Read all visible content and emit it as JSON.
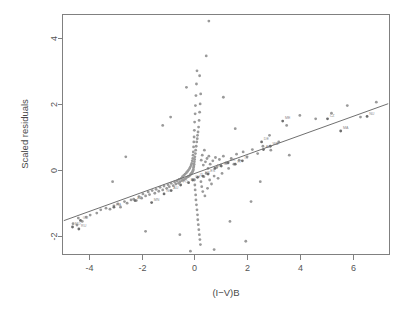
{
  "figure": {
    "title": "",
    "background_color": "#ffffff",
    "width": 411,
    "height": 313
  },
  "axes": {
    "x_title": "(I−V)B",
    "y_title": "Scaled residuals",
    "x_ticks": [
      "-4",
      "-2",
      "0",
      "2",
      "4",
      "6"
    ],
    "y_ticks": [
      "-2",
      "0",
      "2",
      "4"
    ],
    "frame_color": "#808080",
    "tick_color": "#555555"
  },
  "chart_data": {
    "type": "scatter",
    "title": "",
    "xlabel": "(I−V)B",
    "ylabel": "Scaled residuals",
    "xlim": [
      -5.0,
      7.4
    ],
    "ylim": [
      -2.55,
      4.7
    ],
    "xticks": [
      -4,
      -2,
      0,
      2,
      4,
      6
    ],
    "yticks": [
      -2,
      0,
      2,
      4
    ],
    "grid": false,
    "legend": null,
    "point_color": "#9a9a9a",
    "point_size": 1.4,
    "fit_line": {
      "type": "linear",
      "slope": 0.287,
      "intercept": -0.105,
      "x_start": -4.95,
      "y_start": -1.527,
      "x_end": 7.35,
      "y_end": 2.005,
      "color": "#707070"
    },
    "points": [
      [
        -4.6,
        -1.62
      ],
      [
        -4.45,
        -1.66
      ],
      [
        -4.4,
        -1.45
      ],
      [
        -4.25,
        -1.55
      ],
      [
        -4.1,
        -1.42
      ],
      [
        -3.95,
        -1.36
      ],
      [
        -3.7,
        -1.3
      ],
      [
        -3.55,
        -1.2
      ],
      [
        -3.35,
        -1.15
      ],
      [
        -3.2,
        -1.18
      ],
      [
        -3.05,
        -1.08
      ],
      [
        -2.9,
        -1.02
      ],
      [
        -2.8,
        -1.12
      ],
      [
        -2.65,
        -0.95
      ],
      [
        -2.55,
        -1.0
      ],
      [
        -2.4,
        -0.9
      ],
      [
        -2.3,
        -0.88
      ],
      [
        -2.2,
        -0.92
      ],
      [
        -2.1,
        -0.8
      ],
      [
        -2.0,
        -0.85
      ],
      [
        -1.95,
        -0.72
      ],
      [
        -1.85,
        -0.78
      ],
      [
        -1.75,
        -0.66
      ],
      [
        -1.7,
        -0.74
      ],
      [
        -1.6,
        -0.62
      ],
      [
        -1.5,
        -0.7
      ],
      [
        -1.45,
        -0.58
      ],
      [
        -1.35,
        -0.64
      ],
      [
        -1.3,
        -0.52
      ],
      [
        -1.2,
        -0.6
      ],
      [
        -1.15,
        -0.48
      ],
      [
        -1.05,
        -0.55
      ],
      [
        -1.0,
        -0.44
      ],
      [
        -0.95,
        -0.5
      ],
      [
        -0.88,
        -0.4
      ],
      [
        -0.8,
        -0.47
      ],
      [
        -0.75,
        -0.36
      ],
      [
        -0.7,
        -0.42
      ],
      [
        -0.65,
        -0.33
      ],
      [
        -0.6,
        -0.4
      ],
      [
        -0.58,
        -0.28
      ],
      [
        -0.55,
        -0.36
      ],
      [
        -0.5,
        -0.25
      ],
      [
        -0.48,
        -0.32
      ],
      [
        -0.45,
        -0.2
      ],
      [
        -0.42,
        -0.3
      ],
      [
        -0.4,
        -0.16
      ],
      [
        -0.38,
        -0.28
      ],
      [
        -0.35,
        -0.12
      ],
      [
        -0.33,
        -0.26
      ],
      [
        -0.3,
        -0.08
      ],
      [
        -0.28,
        -0.22
      ],
      [
        -0.26,
        -0.04
      ],
      [
        -0.24,
        -0.2
      ],
      [
        -0.22,
        0.0
      ],
      [
        -0.2,
        -0.18
      ],
      [
        -0.18,
        0.05
      ],
      [
        -0.16,
        -0.15
      ],
      [
        -0.15,
        0.1
      ],
      [
        -0.14,
        -0.12
      ],
      [
        -0.12,
        0.15
      ],
      [
        -0.11,
        -0.1
      ],
      [
        -0.1,
        0.2
      ],
      [
        -0.09,
        -0.08
      ],
      [
        -0.08,
        0.28
      ],
      [
        -0.07,
        -0.05
      ],
      [
        -0.06,
        0.35
      ],
      [
        -0.05,
        -0.02
      ],
      [
        -0.05,
        0.45
      ],
      [
        -0.04,
        0.02
      ],
      [
        -0.04,
        0.55
      ],
      [
        -0.03,
        0.08
      ],
      [
        -0.03,
        0.7
      ],
      [
        -0.02,
        0.12
      ],
      [
        -0.02,
        0.85
      ],
      [
        -0.01,
        0.18
      ],
      [
        -0.01,
        1.0
      ],
      [
        0.0,
        0.25
      ],
      [
        0.0,
        1.2
      ],
      [
        0.0,
        -0.3
      ],
      [
        0.01,
        0.32
      ],
      [
        0.01,
        1.45
      ],
      [
        0.02,
        -0.45
      ],
      [
        0.02,
        0.4
      ],
      [
        0.03,
        1.7
      ],
      [
        0.03,
        -0.6
      ],
      [
        0.04,
        0.5
      ],
      [
        0.04,
        1.95
      ],
      [
        0.05,
        -0.75
      ],
      [
        0.05,
        0.6
      ],
      [
        0.06,
        2.25
      ],
      [
        0.06,
        -0.9
      ],
      [
        0.07,
        0.72
      ],
      [
        0.08,
        2.6
      ],
      [
        0.08,
        -1.05
      ],
      [
        0.09,
        0.85
      ],
      [
        0.1,
        3.0
      ],
      [
        0.1,
        -1.2
      ],
      [
        0.11,
        0.95
      ],
      [
        0.12,
        -1.35
      ],
      [
        0.12,
        1.05
      ],
      [
        0.13,
        -1.5
      ],
      [
        0.14,
        1.15
      ],
      [
        0.15,
        -1.65
      ],
      [
        0.16,
        1.3
      ],
      [
        0.17,
        -1.8
      ],
      [
        0.18,
        1.5
      ],
      [
        0.19,
        -1.95
      ],
      [
        0.2,
        1.75
      ],
      [
        0.21,
        -2.1
      ],
      [
        0.22,
        2.0
      ],
      [
        0.23,
        -2.25
      ],
      [
        0.24,
        2.3
      ],
      [
        0.25,
        -0.35
      ],
      [
        0.26,
        0.3
      ],
      [
        0.28,
        -0.5
      ],
      [
        0.3,
        0.45
      ],
      [
        0.32,
        -0.65
      ],
      [
        0.34,
        0.15
      ],
      [
        0.36,
        -0.2
      ],
      [
        0.38,
        0.6
      ],
      [
        0.4,
        -0.78
      ],
      [
        0.42,
        0.25
      ],
      [
        0.45,
        -0.1
      ],
      [
        0.48,
        0.35
      ],
      [
        0.5,
        -0.55
      ],
      [
        0.52,
        0.05
      ],
      [
        0.55,
        0.42
      ],
      [
        0.58,
        -0.3
      ],
      [
        0.6,
        0.18
      ],
      [
        0.65,
        -0.42
      ],
      [
        0.7,
        0.28
      ],
      [
        0.75,
        -0.18
      ],
      [
        0.8,
        0.38
      ],
      [
        0.85,
        0.08
      ],
      [
        0.9,
        -0.25
      ],
      [
        0.95,
        0.32
      ],
      [
        1.0,
        0.15
      ],
      [
        1.05,
        -0.1
      ],
      [
        1.1,
        0.42
      ],
      [
        1.2,
        0.22
      ],
      [
        1.3,
        0.05
      ],
      [
        1.4,
        0.35
      ],
      [
        1.5,
        0.18
      ],
      [
        1.6,
        0.48
      ],
      [
        1.7,
        0.3
      ],
      [
        1.85,
        0.55
      ],
      [
        2.0,
        0.4
      ],
      [
        2.2,
        0.62
      ],
      [
        2.4,
        0.5
      ],
      [
        2.6,
        0.72
      ],
      [
        2.9,
        0.6
      ],
      [
        3.2,
        0.85
      ],
      [
        3.5,
        1.35
      ],
      [
        4.0,
        1.65
      ],
      [
        4.6,
        1.55
      ],
      [
        5.2,
        1.72
      ],
      [
        5.8,
        1.95
      ],
      [
        6.3,
        1.6
      ],
      [
        6.9,
        2.05
      ],
      [
        0.55,
        4.5
      ],
      [
        0.45,
        3.45
      ],
      [
        -0.3,
        2.5
      ],
      [
        1.1,
        2.2
      ],
      [
        -1.2,
        1.35
      ],
      [
        1.55,
        1.25
      ],
      [
        -0.55,
        -1.95
      ],
      [
        1.35,
        -1.55
      ],
      [
        2.15,
        -0.95
      ],
      [
        -2.6,
        0.4
      ],
      [
        2.85,
        1.05
      ],
      [
        -0.9,
        1.6
      ],
      [
        0.75,
        -2.4
      ],
      [
        3.6,
        0.45
      ],
      [
        -1.85,
        -1.85
      ],
      [
        1.95,
        -2.15
      ],
      [
        0.2,
        2.85
      ],
      [
        -0.15,
        -2.45
      ],
      [
        2.5,
        -0.35
      ],
      [
        -3.1,
        -0.35
      ]
    ],
    "labeled_points": [
      {
        "label": "MO",
        "x": -4.62,
        "y": -1.72
      },
      {
        "label": "RU",
        "x": -4.38,
        "y": -1.78
      },
      {
        "label": "GU",
        "x": -4.32,
        "y": -1.52
      },
      {
        "label": "HA",
        "x": -3.05,
        "y": -1.12
      },
      {
        "label": "AZ",
        "x": -2.25,
        "y": -0.92
      },
      {
        "label": "MN",
        "x": -1.62,
        "y": -0.98
      },
      {
        "label": "NO",
        "x": -1.15,
        "y": -0.72
      },
      {
        "label": "AU",
        "x": -0.88,
        "y": -0.62
      },
      {
        "label": "PO",
        "x": -0.52,
        "y": -0.45
      },
      {
        "label": "BE",
        "x": -0.22,
        "y": -0.38
      },
      {
        "label": "CH",
        "x": -0.06,
        "y": -0.3
      },
      {
        "label": "IT",
        "x": 0.12,
        "y": -0.22
      },
      {
        "label": "FR",
        "x": 0.32,
        "y": -0.18
      },
      {
        "label": "ES",
        "x": 0.52,
        "y": -0.12
      },
      {
        "label": "NL",
        "x": 0.78,
        "y": 0.05
      },
      {
        "label": "SE",
        "x": 1.02,
        "y": 0.12
      },
      {
        "label": "DK",
        "x": 1.28,
        "y": 0.22
      },
      {
        "label": "FI",
        "x": 1.55,
        "y": 0.18
      },
      {
        "label": "IS",
        "x": 1.82,
        "y": 0.28
      },
      {
        "label": "AL",
        "x": 2.62,
        "y": 0.62
      },
      {
        "label": "WA",
        "x": 2.88,
        "y": 0.72
      },
      {
        "label": "DE",
        "x": 2.55,
        "y": 0.85
      },
      {
        "label": "ME",
        "x": 3.35,
        "y": 1.48
      },
      {
        "label": "CZ",
        "x": 5.05,
        "y": 1.55
      },
      {
        "label": "NU",
        "x": 6.55,
        "y": 1.62
      },
      {
        "label": "MA",
        "x": 5.55,
        "y": 1.18
      }
    ]
  }
}
